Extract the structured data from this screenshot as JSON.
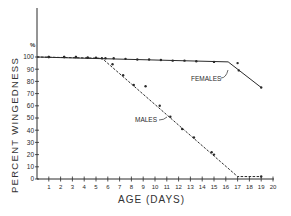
{
  "chart_data": {
    "type": "line",
    "title": "",
    "xlabel": "AGE (DAYS)",
    "ylabel": "PERCENT WINGEDNESS",
    "y_unit_label": "%",
    "xlim": [
      0,
      20
    ],
    "ylim": [
      0,
      100
    ],
    "x_ticks": [
      1,
      2,
      3,
      4,
      5,
      6,
      7,
      8,
      9,
      10,
      11,
      12,
      13,
      14,
      15,
      16,
      17,
      18,
      19,
      20
    ],
    "y_ticks": [
      0,
      10,
      20,
      30,
      40,
      50,
      60,
      70,
      80,
      90,
      100
    ],
    "grid": false,
    "legend": "inline labels",
    "series": [
      {
        "name": "FEMALES",
        "line_style": "solid",
        "fitted_line": [
          [
            0,
            100
          ],
          [
            16.2,
            96
          ],
          [
            19,
            75
          ]
        ],
        "points": [
          [
            1,
            100
          ],
          [
            2.3,
            100
          ],
          [
            3.3,
            100
          ],
          [
            4.3,
            99.5
          ],
          [
            5,
            99.5
          ],
          [
            5.8,
            99
          ],
          [
            6.5,
            99
          ],
          [
            7.5,
            98.5
          ],
          [
            8.5,
            98
          ],
          [
            9.5,
            98
          ],
          [
            10.5,
            97.5
          ],
          [
            11.5,
            97
          ],
          [
            12.5,
            97
          ],
          [
            13.5,
            96.5
          ],
          [
            15,
            96
          ],
          [
            17,
            95
          ],
          [
            17.1,
            89
          ],
          [
            19,
            75
          ]
        ]
      },
      {
        "name": "MALES",
        "line_style": "dashed",
        "fitted_line": [
          [
            0,
            100
          ],
          [
            5.5,
            99
          ],
          [
            17,
            2
          ],
          [
            19,
            2
          ]
        ],
        "points": [
          [
            1,
            100
          ],
          [
            2.3,
            100
          ],
          [
            3.3,
            100
          ],
          [
            4.3,
            99.5
          ],
          [
            5.5,
            99
          ],
          [
            6.4,
            94
          ],
          [
            7.3,
            85
          ],
          [
            8.2,
            77
          ],
          [
            9.2,
            76
          ],
          [
            10.4,
            60
          ],
          [
            11.3,
            51
          ],
          [
            12.3,
            41
          ],
          [
            13.3,
            34
          ],
          [
            14.8,
            22
          ],
          [
            15,
            20
          ],
          [
            19,
            2
          ]
        ]
      }
    ],
    "annotations": [
      {
        "text": "FEMALES",
        "x": 13.5,
        "y": 88
      },
      {
        "text": "MALES",
        "x": 8.6,
        "y": 54
      }
    ]
  },
  "axes": {
    "ylabel": "PERCENT WINGEDNESS",
    "xlabel": "AGE (DAYS)",
    "pct": "%"
  }
}
